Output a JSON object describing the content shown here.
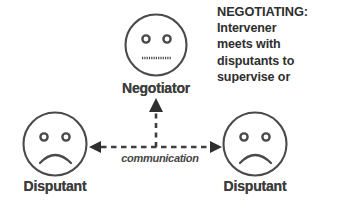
{
  "diagram": {
    "title_text": "NEGOTIATING:",
    "nodes": [
      {
        "id": "negotiator",
        "label": "Negotiator",
        "expression": "neutral",
        "icon": "neutral-face-icon",
        "position": "top-center"
      },
      {
        "id": "disputant-left",
        "label": "Disputant",
        "expression": "sad",
        "icon": "sad-face-icon",
        "position": "bottom-left"
      },
      {
        "id": "disputant-right",
        "label": "Disputant",
        "expression": "sad",
        "icon": "sad-face-icon",
        "position": "bottom-right"
      }
    ],
    "connectors": [
      {
        "id": "communication",
        "label": "communication",
        "style": "dashed",
        "arrowheads": "both",
        "orientation": "horizontal"
      },
      {
        "id": "to-negotiator",
        "label": "",
        "style": "dashed",
        "arrowheads": "up",
        "orientation": "vertical"
      }
    ]
  },
  "caption": {
    "heading": "NEGOTIATING:",
    "lines": [
      "Intervener",
      "meets with",
      "disputants to",
      "supervise or"
    ]
  },
  "colors": {
    "ink": "#3d3d3d",
    "stroke": "#4a4a4a",
    "background": "#ffffff"
  }
}
